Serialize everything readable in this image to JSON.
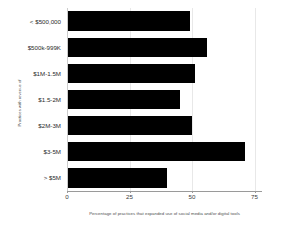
{
  "chart_data": {
    "type": "bar",
    "orientation": "horizontal",
    "title": "",
    "subtitle": "",
    "xlabel": "Percentage of practices that expanded use of social media and/or digital tools",
    "ylabel": "Practices with revenue of",
    "categories": [
      "< $500,000",
      "$500k-999K",
      "$1M-1.5M",
      "$1.5-2M",
      "$2M-3M",
      "$3-5M",
      "> $5M"
    ],
    "values": [
      49,
      56,
      51,
      45,
      50,
      71,
      40
    ],
    "xlim": [
      0,
      78
    ],
    "xticks": [
      0,
      25,
      50,
      75
    ],
    "xtick_labels": [
      "0",
      "25",
      "50",
      "75"
    ],
    "grid": true,
    "grid_axis": "x",
    "legend": null,
    "bar_color": "#000000",
    "background_color": "#ffffff",
    "axis_color": "#9a9a9a",
    "grid_color": "#e8e8e8",
    "label_color": "#4d4d4d"
  }
}
